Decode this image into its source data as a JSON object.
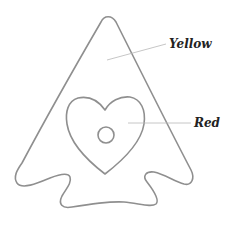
{
  "diagram": {
    "type": "coloring-page",
    "shapes": [
      {
        "name": "triangle-arrowhead",
        "fill_label": "Yellow"
      },
      {
        "name": "heart",
        "fill_label": "Red"
      },
      {
        "name": "small-circle",
        "fill_label": ""
      }
    ],
    "labels": {
      "yellow": "Yellow",
      "red": "Red"
    },
    "colors": {
      "outline": "#8f8f8f",
      "leader": "#b8b8b8",
      "text": "#222222",
      "background": "#ffffff"
    }
  }
}
